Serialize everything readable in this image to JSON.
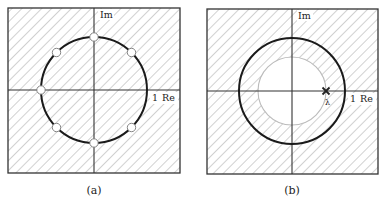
{
  "figure": {
    "panels": [
      {
        "id": "a",
        "caption": "(a)",
        "im_label": "Im",
        "re_label": "Re",
        "unit_label": "1",
        "unit_circle": true,
        "markers": "open circles at 45°, 90°, 135°, 180°, 225°, 270°, 315° on unit circle",
        "shading": "hatched outside and inside"
      },
      {
        "id": "b",
        "caption": "(b)",
        "im_label": "Im",
        "re_label": "Re",
        "unit_label": "1",
        "point_label": "λ",
        "unit_circle": true,
        "inner_circle": "unshaded disk of radius |λ|",
        "cross_marker": "× at λ on positive real axis",
        "shading": "hatched except inner disk"
      }
    ],
    "colors": {
      "frame": "#333333",
      "axis": "#333333",
      "unit_circle": "#1a1a1a",
      "hatch": "#bdbdbd",
      "inner_circle": "#bbbbbb",
      "marker_fill": "#ffffff"
    }
  }
}
